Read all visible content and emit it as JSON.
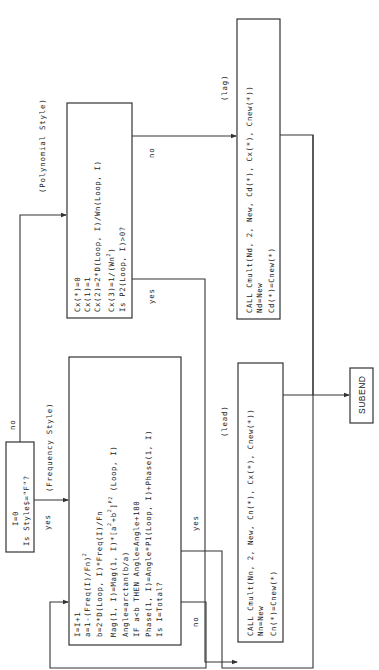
{
  "diagram": {
    "orientation": "rotated-90-ccw",
    "nodes": {
      "start": {
        "lines": [
          "I=0",
          "Is Style$=\"F\"?"
        ]
      },
      "frequency": {
        "label": "(Frequency Style)",
        "lines": [
          "I=I+1",
          "a=1-(Freq(I)/Fn)²",
          "b=2*D(Loop, I)*Freq(I)/Fn",
          "Mag(1, I)=Mag(1, I)*[a²+b²]^P2(Loop, I)",
          "Angle=arctan(b/a)",
          "IF a<b THEN Angle=Angle+180",
          "Phase(1, I)=Angle*P1(Loop, I)+Phase(1, I)",
          "Is I=Total?"
        ]
      },
      "polynomial": {
        "label": "(Polynomial Style)",
        "lines": [
          "Cx(*)=0",
          "Cx(1)=1",
          "Cx(2)=2*D(Loop, I)/Wn(Loop, I)",
          "Cx(3)=1/(Wn²)",
          "Is P2(Loop, I)>0?"
        ]
      },
      "lag": {
        "label": "(lag)",
        "lines": [
          "CALL Cmult(Nd, 2, New, Cd(*), Cx(*), Cnew(*))",
          "Nd=New",
          "Cd(*)=Cnew(*)"
        ]
      },
      "lead": {
        "label": "(lead)",
        "lines": [
          "CALL Cmult(Nn, 2, New, Cn(*), Cx(*), Cnew(*))",
          "Nn=New",
          "Cn(*)=Cnew(*)"
        ]
      },
      "end": {
        "label": "SUBEND"
      }
    },
    "edge_labels": {
      "start_yes": "yes",
      "start_no": "no",
      "freq_yes": "yes",
      "freq_no": "no",
      "poly_yes": "yes",
      "poly_no": "no"
    },
    "colors": {
      "stroke": "#333333",
      "text": "#222222",
      "background": "#ffffff"
    }
  }
}
